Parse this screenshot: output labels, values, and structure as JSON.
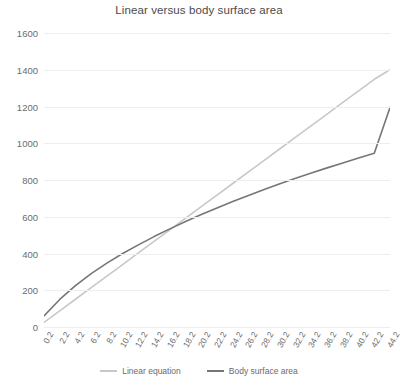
{
  "chart_data": {
    "type": "line",
    "title": "Linear versus body surface area",
    "xlabel": "",
    "ylabel": "",
    "xlim": [
      0.2,
      44.2
    ],
    "ylim": [
      0,
      1600
    ],
    "grid": true,
    "legend_position": "bottom",
    "ytick_labels": [
      "1600",
      "1400",
      "1200",
      "1000",
      "800",
      "600",
      "400",
      "200",
      "0"
    ],
    "yticks": [
      1600,
      1400,
      1200,
      1000,
      800,
      600,
      400,
      200,
      0
    ],
    "x": [
      0.2,
      2.2,
      4.2,
      6.2,
      8.2,
      10.2,
      12.2,
      14.2,
      16.2,
      18.2,
      20.2,
      22.2,
      24.2,
      26.2,
      28.2,
      30.2,
      32.2,
      34.2,
      36.2,
      38.2,
      40.2,
      42.2,
      44.2
    ],
    "xtick_labels": [
      "0.2",
      "2.2",
      "4.2",
      "6.2",
      "8.2",
      "10.2",
      "12.2",
      "14.2",
      "16.2",
      "18.2",
      "20.2",
      "22.2",
      "24.2",
      "26.2",
      "28.2",
      "30.2",
      "32.2",
      "34.2",
      "36.2",
      "38.2",
      "40.2",
      "42.2",
      "44.2"
    ],
    "series": [
      {
        "name": "Linear equation",
        "color": "#c8c8c8",
        "values": [
          25,
          88,
          151,
          214,
          277,
          340,
          403,
          466,
          529,
          592,
          655,
          718,
          781,
          844,
          907,
          970,
          1033,
          1096,
          1159,
          1222,
          1285,
          1348,
          1400
        ]
      },
      {
        "name": "Body surface area",
        "color": "#767676",
        "values": [
          60,
          150,
          225,
          290,
          348,
          400,
          447,
          492,
          534,
          574,
          612,
          648,
          683,
          716,
          748,
          779,
          809,
          838,
          866,
          893,
          920,
          946,
          1195
        ]
      }
    ]
  },
  "legend": {
    "items": [
      {
        "label": "Linear equation",
        "color": "#c8c8c8"
      },
      {
        "label": "Body surface area",
        "color": "#767676"
      }
    ]
  }
}
